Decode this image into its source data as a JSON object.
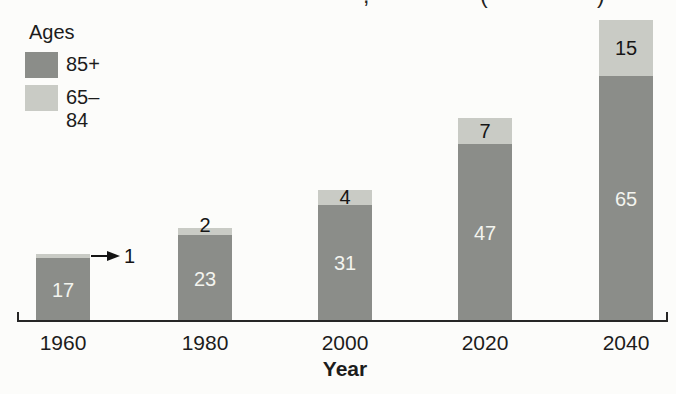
{
  "page": {
    "cropped_title_fragments": [
      {
        "glyph": ",",
        "x": 363
      },
      {
        "glyph": "(",
        "x": 480
      },
      {
        "glyph": ")",
        "x": 597
      }
    ]
  },
  "legend": {
    "title": "Ages",
    "items": [
      {
        "label": "85+",
        "color": "#8b8d89"
      },
      {
        "label": "65–84",
        "color": "#c9cbc5"
      }
    ]
  },
  "chart_data": {
    "type": "bar",
    "stacked": true,
    "categories": [
      "1960",
      "1980",
      "2000",
      "2020",
      "2040"
    ],
    "series": [
      {
        "name": "85+",
        "color": "#8b8d89",
        "label_color": "#f3f4ef",
        "values": [
          17,
          23,
          31,
          47,
          65
        ]
      },
      {
        "name": "65–84",
        "color": "#c9cbc5",
        "label_color": "#161616",
        "values": [
          1,
          2,
          4,
          7,
          15
        ]
      }
    ],
    "xlabel": "Year",
    "value_labels_shown": true,
    "annotations": [
      {
        "text": "1",
        "category": "1960",
        "series": "65–84",
        "type": "arrow-callout"
      }
    ],
    "legend_position": "top-left",
    "grid": false,
    "axis_color": "#262626",
    "background_color": "#fcfcfa"
  }
}
